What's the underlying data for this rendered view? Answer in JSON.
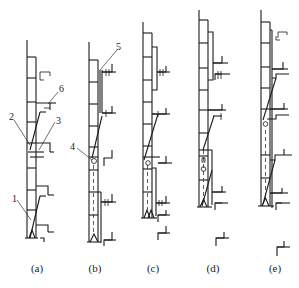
{
  "figure": {
    "panels": [
      {
        "id": "a",
        "caption": "(a)"
      },
      {
        "id": "b",
        "caption": "(b)"
      },
      {
        "id": "c",
        "caption": "(c)"
      },
      {
        "id": "d",
        "caption": "(d)"
      },
      {
        "id": "e",
        "caption": "(e)"
      }
    ],
    "callouts": [
      {
        "number": "1",
        "panel": "a"
      },
      {
        "number": "2",
        "panel": "a"
      },
      {
        "number": "3",
        "panel": "a"
      },
      {
        "number": "4",
        "panel": "b"
      },
      {
        "number": "5",
        "panel": "b"
      },
      {
        "number": "6",
        "panel": "a"
      }
    ],
    "colors": {
      "line": "#1a1a1a",
      "background": "#ffffff"
    }
  }
}
